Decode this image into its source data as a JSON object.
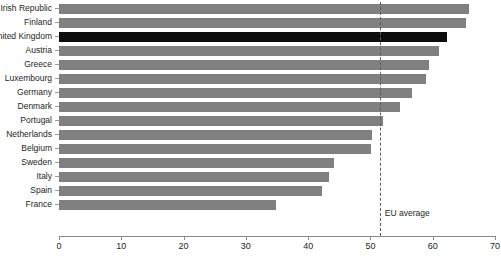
{
  "chart_data": {
    "type": "bar",
    "orientation": "horizontal",
    "title": "",
    "xlabel": "",
    "ylabel": "",
    "xlim": [
      0,
      70
    ],
    "xticks": [
      0,
      10,
      20,
      30,
      40,
      50,
      60,
      70
    ],
    "grid": false,
    "legend": null,
    "categories": [
      "Irish Republic",
      "Finland",
      "United Kingdom",
      "Austria",
      "Greece",
      "Luxembourg",
      "Germany",
      "Denmark",
      "Portugal",
      "Netherlands",
      "Belgium",
      "Sweden",
      "Italy",
      "Spain",
      "France"
    ],
    "values": [
      65.8,
      65.3,
      62.3,
      61.0,
      59.4,
      59.0,
      56.7,
      54.8,
      52.0,
      50.3,
      50.1,
      44.1,
      43.4,
      42.2,
      34.9
    ],
    "highlight_category": "United Kingdom",
    "colors": {
      "bar": "#808080",
      "bar_highlight": "#0d0d0d",
      "axis": "#8a8a8a",
      "text": "#231f20",
      "reference_line": "#5b5b5b"
    },
    "annotations": [
      {
        "name": "eu-average",
        "label": "EU average",
        "value": 51.5
      }
    ]
  }
}
